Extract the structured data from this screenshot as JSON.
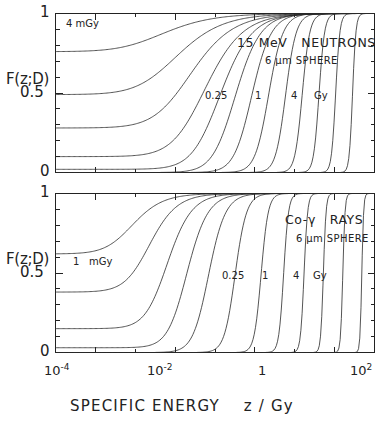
{
  "figure": {
    "y_axis_label": "F(z;D)",
    "x_axis_label": "SPECIFIC ENERGY    z / Gy",
    "y_ticks": [
      "1",
      "0.5",
      "0"
    ],
    "x_ticks": [
      {
        "mantissa": "10",
        "exponent": "-4"
      },
      {
        "mantissa": "10",
        "exponent": "-2"
      },
      {
        "mantissa": "1",
        "exponent": ""
      },
      {
        "mantissa": "10",
        "exponent": "2"
      }
    ],
    "panels": [
      {
        "id": "neutrons",
        "title": "15 MeV   NEUTRONS",
        "subtitle": "6 µm SPHERE",
        "first_curve_label": "4 mGy",
        "dose_labels": [
          "0.25",
          "1",
          "4",
          "Gy"
        ]
      },
      {
        "id": "gamma",
        "title": "Co-γ   RAYS",
        "subtitle": "6 µm SPHERE",
        "first_curve_label": "1",
        "first_curve_unit": "mGy",
        "dose_labels": [
          "0.25",
          "1",
          "4",
          "Gy"
        ]
      }
    ]
  },
  "chart_data": {
    "type": "line",
    "xlabel": "SPECIFIC ENERGY    z / Gy",
    "ylabel": "F(z;D)",
    "xscale": "log",
    "xlim": [
      1e-05,
      1000
    ],
    "ylim": [
      0,
      1
    ],
    "grid": false,
    "legend": "inline-curve-labels",
    "x_tick_values": [
      0.0001,
      0.01,
      1,
      100
    ],
    "x_tick_labels": [
      "10^-4",
      "10^-2",
      "1",
      "10^2"
    ],
    "y_tick_values": [
      0,
      0.5,
      1
    ],
    "y_tick_labels": [
      "0",
      "0.5",
      "1"
    ],
    "panels": [
      {
        "name": "15 MeV NEUTRONS",
        "site": "6 um SPHERE",
        "annotation_labels": [
          "4 mGy",
          "0.25",
          "1",
          "4",
          "Gy"
        ],
        "series": [
          {
            "name": "D = 4 mGy",
            "dose_gy": 0.004,
            "F0": 0.76,
            "z_half": 0.0016,
            "width_decades": 2.45
          },
          {
            "name": "D = 0.016 Gy",
            "dose_gy": 0.016,
            "F0": 0.49,
            "z_half": 0.0042,
            "width_decades": 2.25
          },
          {
            "name": "D = 0.063 Gy",
            "dose_gy": 0.063,
            "F0": 0.28,
            "z_half": 0.011,
            "width_decades": 2.05
          },
          {
            "name": "D = 0.25 Gy",
            "dose_gy": 0.25,
            "F0": 0.1,
            "z_half": 0.03,
            "width_decades": 1.8
          },
          {
            "name": "D = 1 Gy",
            "dose_gy": 1.0,
            "F0": 0.02,
            "z_half": 0.085,
            "width_decades": 1.5
          },
          {
            "name": "D = 4 Gy",
            "dose_gy": 4.0,
            "F0": 0.0,
            "z_half": 0.24,
            "width_decades": 1.18
          },
          {
            "name": "D = 16 Gy",
            "dose_gy": 16.0,
            "F0": 0.0,
            "z_half": 0.7,
            "width_decades": 0.9
          },
          {
            "name": "D = 63 Gy",
            "dose_gy": 63.0,
            "F0": 0.0,
            "z_half": 2.0,
            "width_decades": 0.66
          },
          {
            "name": "D = 250 Gy",
            "dose_gy": 250.0,
            "F0": 0.0,
            "z_half": 5.6,
            "width_decades": 0.48
          },
          {
            "name": "D = 1000 Gy",
            "dose_gy": 1000.0,
            "F0": 0.0,
            "z_half": 15.0,
            "width_decades": 0.34
          },
          {
            "name": "D = 4000 Gy",
            "dose_gy": 4000.0,
            "F0": 0.0,
            "z_half": 40.0,
            "width_decades": 0.25
          },
          {
            "name": "D = 16000 Gy",
            "dose_gy": 16000.0,
            "F0": 0.0,
            "z_half": 105.0,
            "width_decades": 0.19
          },
          {
            "name": "D = 63000 Gy",
            "dose_gy": 63000.0,
            "F0": 0.0,
            "z_half": 280.0,
            "width_decades": 0.15
          }
        ]
      },
      {
        "name": "Co-gamma RAYS",
        "site": "6 um SPHERE",
        "annotation_labels": [
          "1 mGy",
          "0.25",
          "1",
          "4",
          "Gy"
        ],
        "series": [
          {
            "name": "D = 1 mGy",
            "dose_gy": 0.001,
            "F0": 0.62,
            "z_half": 0.00055,
            "width_decades": 1.45
          },
          {
            "name": "D = 4 mGy",
            "dose_gy": 0.004,
            "F0": 0.38,
            "z_half": 0.0016,
            "width_decades": 1.3
          },
          {
            "name": "D = 0.016 Gy",
            "dose_gy": 0.016,
            "F0": 0.15,
            "z_half": 0.0048,
            "width_decades": 1.15
          },
          {
            "name": "D = 0.063 Gy",
            "dose_gy": 0.063,
            "F0": 0.03,
            "z_half": 0.016,
            "width_decades": 0.98
          },
          {
            "name": "D = 0.25 Gy",
            "dose_gy": 0.25,
            "F0": 0.0,
            "z_half": 0.06,
            "width_decades": 0.78
          },
          {
            "name": "D = 1 Gy",
            "dose_gy": 1.0,
            "F0": 0.0,
            "z_half": 0.3,
            "width_decades": 0.52
          },
          {
            "name": "D = 4 Gy",
            "dose_gy": 4.0,
            "F0": 0.0,
            "z_half": 1.4,
            "width_decades": 0.32
          },
          {
            "name": "D = 16 Gy",
            "dose_gy": 16.0,
            "F0": 0.0,
            "z_half": 5.2,
            "width_decades": 0.22
          },
          {
            "name": "D = 63 Gy",
            "dose_gy": 63.0,
            "F0": 0.0,
            "z_half": 17.0,
            "width_decades": 0.16
          },
          {
            "name": "D = 250 Gy",
            "dose_gy": 250.0,
            "F0": 0.0,
            "z_half": 52.0,
            "width_decades": 0.12
          },
          {
            "name": "D = 1000 Gy",
            "dose_gy": 1000.0,
            "F0": 0.0,
            "z_half": 160.0,
            "width_decades": 0.1
          },
          {
            "name": "D = 4000 Gy",
            "dose_gy": 4000.0,
            "F0": 0.0,
            "z_half": 480.0,
            "width_decades": 0.08
          }
        ]
      }
    ]
  }
}
